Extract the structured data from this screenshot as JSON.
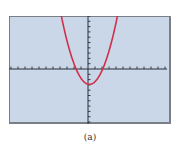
{
  "chart_data": {
    "type": "line",
    "title": "",
    "caption": "(a)",
    "xlabel": "",
    "ylabel": "",
    "xlim": [
      -11,
      11
    ],
    "ylim": [
      -10,
      10
    ],
    "xtick_step": 1,
    "ytick_step": 1,
    "tick_labels": false,
    "grid": false,
    "legend": null,
    "series": [
      {
        "name": "parabola",
        "equation": "y = 0.8(x - 0.2)^2 - 2.9",
        "color": "#d0304a",
        "vertex": [
          0.2,
          -2.9
        ],
        "x_intercepts": [
          -1.7,
          2.1
        ],
        "y_intercept": -2.87,
        "x": [
          -3.8,
          -3.0,
          -2.0,
          -1.7,
          -1.0,
          0.0,
          0.2,
          1.0,
          2.0,
          2.1,
          3.0,
          4.0,
          4.2
        ],
        "y": [
          9.9,
          5.3,
          1.0,
          0.0,
          -1.75,
          -2.87,
          -2.9,
          -2.39,
          -0.31,
          0.0,
          3.37,
          8.65,
          9.9
        ]
      }
    ]
  },
  "colors": {
    "screen_background": "#c9d7e8",
    "frame_border": "#7a7f86",
    "axis": "#2b2f36",
    "curve": "#d0304a",
    "caption_text": "#333333"
  }
}
